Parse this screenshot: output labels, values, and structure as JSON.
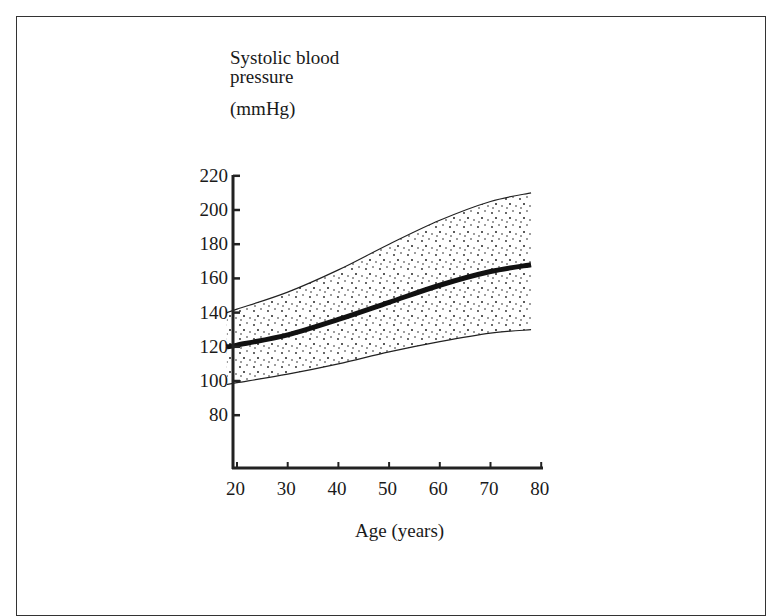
{
  "chart_data": {
    "type": "area",
    "title": "",
    "ylabel_line1": "Systolic blood",
    "ylabel_line2": "pressure",
    "ylabel_unit": "(mmHg)",
    "xlabel": "Age (years)",
    "xlim": [
      18,
      80
    ],
    "ylim": [
      60,
      220
    ],
    "x_ticks": [
      "20",
      "30",
      "40",
      "50",
      "60",
      "70",
      "80"
    ],
    "y_ticks": [
      "220",
      "200",
      "180",
      "160",
      "140",
      "120",
      "100",
      "80"
    ],
    "grid": false,
    "legend": null,
    "x": [
      18,
      20,
      30,
      40,
      50,
      60,
      70,
      78
    ],
    "series": [
      {
        "name": "Upper bound",
        "values": [
          140,
          142,
          152,
          165,
          180,
          194,
          205,
          210
        ]
      },
      {
        "name": "Mean",
        "values": [
          120,
          121,
          127,
          136,
          146,
          156,
          164,
          168
        ]
      },
      {
        "name": "Lower bound",
        "values": [
          98,
          99,
          104,
          110,
          117,
          123,
          128,
          130
        ]
      }
    ],
    "band_fill": "stippled",
    "band_between": [
      "Lower bound",
      "Upper bound"
    ]
  }
}
